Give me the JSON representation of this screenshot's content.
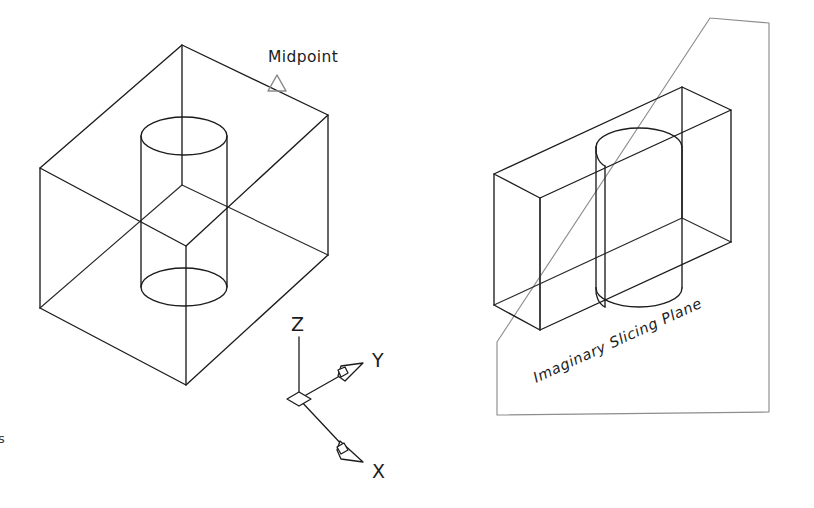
{
  "page": {
    "width": 814,
    "height": 508,
    "background": "#ffffff"
  },
  "style": {
    "line_color": "#1c1c1c",
    "plane_line_color": "#8d8d8d",
    "marker_color": "#8a8a8a",
    "text_color": "#1c1c1c"
  },
  "labels": {
    "midpoint": "Midpoint",
    "slicing_plane": "Imaginary Slicing Plane",
    "axis_z": "Z",
    "axis_y": "Y",
    "axis_x": "X",
    "edge_fragment": "s"
  },
  "figures": {
    "left": {
      "name": "rectangular-block-with-through-hole",
      "description": "Isometric wireframe rectangular prism with a vertical cylindrical through hole",
      "block": {
        "top_face": "40,168 182,45 328,115 186,246",
        "front_left_face": "40,168 186,246 186,385 40,308",
        "front_right_face": "186,246 328,115 328,255 186,385",
        "vertices": {
          "top_left": "40,168",
          "top_back": "182,45",
          "top_right": "328,115",
          "top_front": "186,246",
          "bottom_left": "40,308",
          "bottom_right": "328,255",
          "bottom_front": "186,385"
        }
      },
      "hole": {
        "type": "cylinder-through-hole",
        "top_ellipse": {
          "cx": 184,
          "cy": 136,
          "rx": 43,
          "ry": 19
        },
        "bottom_ellipse": {
          "cx": 184,
          "cy": 287,
          "rx": 43,
          "ry": 19
        },
        "left_side_x": 141,
        "right_side_x": 227
      },
      "marker": {
        "type": "midpoint-osnap-triangle",
        "cx": 277,
        "cy": 84,
        "size": 11
      },
      "label_position": {
        "x": 268,
        "y": 62
      }
    },
    "right": {
      "name": "sliced-half-block-with-half-hole",
      "description": "Isometric half of the block after slicing, shown with the imaginary slicing plane",
      "slicing_plane": {
        "corners": "710,18 769,23 769,412 497,415",
        "note": "Large transparent quadrilateral drawn in light gray"
      },
      "block": {
        "outer": {
          "top_back_left": "494,174",
          "top_back_right": "682,87",
          "top_front_right": "731,110",
          "top_front_left": "540,198",
          "bottom_back_left": "494,305",
          "bottom_front_left": "540,330",
          "bottom_front_right": "731,242",
          "bottom_back_right": "682,218"
        },
        "cut_face_right": "682,87 731,110 731,242 682,218"
      },
      "half_hole": {
        "type": "half-cylinder",
        "top_arc": {
          "cx": 639,
          "cy": 147,
          "rx": 43,
          "ry": 19
        },
        "bottom_arc": {
          "cx": 639,
          "cy": 288,
          "rx": 43,
          "ry": 19
        },
        "cut_line_left_x": 596,
        "cut_line_right_x": 682
      },
      "label": {
        "text_anchor": {
          "x": 536,
          "y": 380
        },
        "rotation_deg": -25
      }
    },
    "axis_triad": {
      "name": "isometric-axis-indicator",
      "origin": {
        "x": 299,
        "y": 399
      },
      "z": {
        "tip_x": 299,
        "tip_y": 337,
        "label_x": 292,
        "label_y": 330
      },
      "y": {
        "tip_x": 358,
        "tip_y": 370,
        "label_x": 374,
        "label_y": 368
      },
      "x": {
        "tip_x": 358,
        "tip_y": 455,
        "label_x": 374,
        "label_y": 475
      }
    }
  }
}
